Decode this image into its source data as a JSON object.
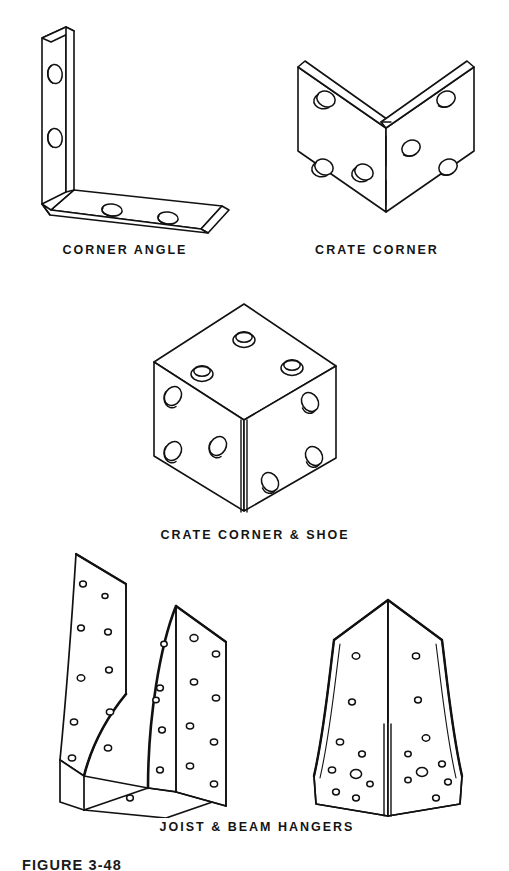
{
  "figure": {
    "number_label": "FIGURE 3-48",
    "background_color": "#ffffff",
    "ink_color": "#111111",
    "width_px": 509,
    "height_px": 871
  },
  "items": [
    {
      "id": "corner-angle",
      "caption": "CORNER ANGLE",
      "hole_count": 4,
      "description": "L-shaped corner angle bracket, isometric view, two holes per leg"
    },
    {
      "id": "crate-corner",
      "caption": "CRATE CORNER",
      "hole_count": 6,
      "description": "V-folded two-face crate corner plate with dashed fold centerline"
    },
    {
      "id": "crate-corner-and-shoe",
      "caption": "CRATE CORNER & SHOE",
      "hole_count": 9,
      "description": "Three-face box corner shoe, cube isometric, three holes per visible face"
    },
    {
      "id": "joist-and-beam-hangers",
      "caption": "JOIST & BEAM HANGERS",
      "hole_count": 46,
      "description": "Two perforated sheet-metal hangers: left saddle-type joist hanger and right flared beam hanger"
    }
  ]
}
